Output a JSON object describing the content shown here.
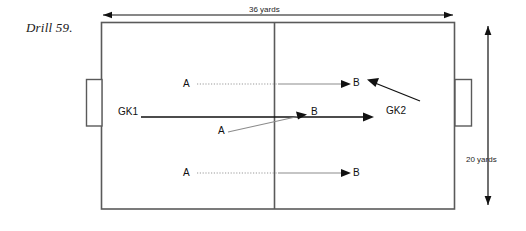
{
  "diagram": {
    "title": "Drill 59.",
    "dimensions": {
      "top_label": "36 yards",
      "right_label": "20 yards"
    },
    "field": {
      "left": 101,
      "top": 22,
      "right": 455,
      "bottom": 209,
      "halfway_x": 274,
      "stroke": "#5a5a5a"
    },
    "goals": [
      {
        "name": "left-goal",
        "x": 86,
        "y": 79,
        "w": 16,
        "h": 47
      },
      {
        "name": "right-goal",
        "x": 454,
        "y": 79,
        "w": 17,
        "h": 47
      }
    ],
    "players": [
      {
        "id": "a-top",
        "label": "A",
        "x": 183,
        "y": 78
      },
      {
        "id": "b-top",
        "label": "B",
        "x": 353,
        "y": 77
      },
      {
        "id": "gk1",
        "label": "GK1",
        "x": 118,
        "y": 106
      },
      {
        "id": "a-mid",
        "label": "A",
        "x": 218,
        "y": 125
      },
      {
        "id": "b-mid",
        "label": "B",
        "x": 311,
        "y": 106
      },
      {
        "id": "gk2",
        "label": "GK2",
        "x": 386,
        "y": 105
      },
      {
        "id": "a-bot",
        "label": "A",
        "x": 183,
        "y": 167
      },
      {
        "id": "b-bot",
        "label": "B",
        "x": 353,
        "y": 167
      }
    ],
    "movements": [
      {
        "id": "pass-top",
        "style": "dotted-gray",
        "from": [
          197,
          84
        ],
        "to": [
          350,
          84
        ]
      },
      {
        "id": "pass-gk1",
        "style": "solid-dark",
        "from": [
          140,
          117
        ],
        "to": [
          373,
          117
        ]
      },
      {
        "id": "pass-mid-diagonal",
        "style": "solid-gray",
        "from": [
          228,
          131
        ],
        "to": [
          305,
          114
        ]
      },
      {
        "id": "pass-bottom",
        "style": "dotted-gray",
        "from": [
          197,
          173
        ],
        "to": [
          350,
          173
        ]
      },
      {
        "id": "run-gk2",
        "style": "solid-dark",
        "from": [
          420,
          101
        ],
        "to": [
          366,
          80
        ]
      }
    ],
    "colors": {
      "line_dark": "#111111",
      "line_gray": "#8c8c8c",
      "field_stroke": "#5a5a5a",
      "dimension": "#1d1d1d",
      "background": "#ffffff"
    }
  }
}
